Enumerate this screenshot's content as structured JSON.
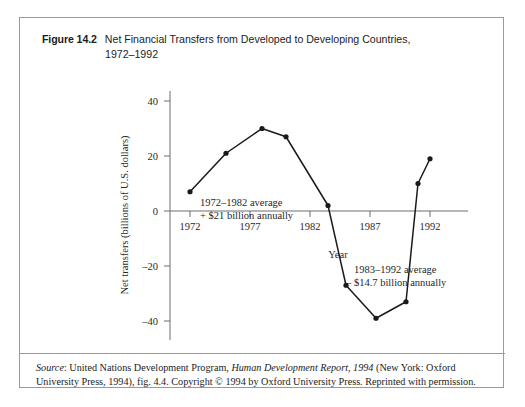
{
  "figure": {
    "label": "Figure 14.2",
    "title_line1": "Net Financial Transfers from Developed to Developing Countries,",
    "title_line2": "1972–1992"
  },
  "source_note": {
    "source_label": "Source",
    "text_part1": ": United Nations Development Program, ",
    "italic_title": "Human Development Report, 1994",
    "text_part2": " (New York: Oxford University Press, 1994), fig. 4.4. Copyright © 1994 by Oxford University Press. Reprinted with permission."
  },
  "annotations": {
    "first": {
      "line1": "1972–1982 average",
      "line2": "+ $21 billion annually"
    },
    "second": {
      "line1": "1983–1992 average",
      "line2": "– $14.7 billion annually"
    }
  },
  "chart_data": {
    "type": "line",
    "title": "Net Financial Transfers from Developed to Developing Countries, 1972–1992",
    "xlabel": "Year",
    "ylabel": "Net transfers (billions of U.S. dollars)",
    "xlim": [
      1970.5,
      1993.5
    ],
    "ylim": [
      -45,
      45
    ],
    "xticks": [
      1972,
      1977,
      1982,
      1987,
      1992
    ],
    "xticklabels": [
      "1972",
      "1977",
      "1982",
      "1987",
      "1992"
    ],
    "yticks": [
      40,
      20,
      0,
      -20,
      -40
    ],
    "yticklabels": [
      "40",
      "20",
      "0",
      "–20",
      "–40"
    ],
    "grid": false,
    "legend": null,
    "marker": "filled-circle",
    "line_color": "#1a1a1a",
    "series": [
      {
        "name": "Net financial transfers",
        "x": [
          1972,
          1975,
          1978,
          1980,
          1983.5,
          1985,
          1987.5,
          1990,
          1991,
          1992
        ],
        "values": [
          7,
          21,
          30,
          27,
          2,
          -27,
          -39,
          -33,
          10,
          19
        ]
      }
    ],
    "annotations": [
      {
        "text": "1972–1982 average + $21 billion annually",
        "x": 1978,
        "y": 10
      },
      {
        "text": "1983–1992 average – $14.7 billion annually",
        "x": 1988,
        "y": -16
      }
    ]
  },
  "axis": {
    "x_title": "Year",
    "y_title": "Net transfers (billions of U.S. dollars)"
  }
}
